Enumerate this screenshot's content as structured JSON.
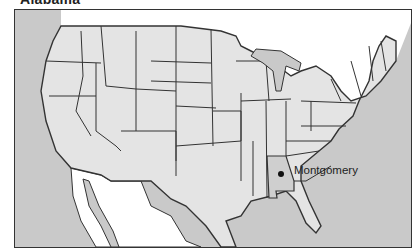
{
  "title": "Alabama",
  "map": {
    "highlighted_state": "Alabama",
    "capital": {
      "name": "Montgomery",
      "marker": "dot"
    },
    "colors": {
      "ocean": "#c9c9c9",
      "states": "#e4e4e4",
      "highlighted_state": "#cfcfcf",
      "foreign_land": "#ffffff",
      "border": "#333333"
    }
  }
}
